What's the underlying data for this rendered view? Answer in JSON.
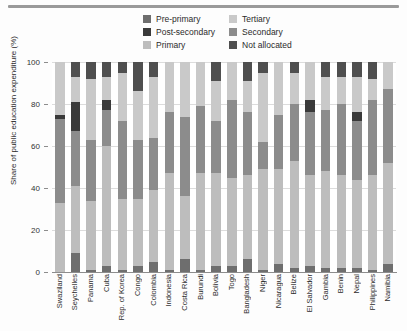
{
  "chart_data": {
    "type": "bar",
    "subtype": "stacked-bar-100",
    "title": "",
    "xlabel": "",
    "ylabel": "Share of public education expenditure (%)",
    "ylim": [
      0,
      100
    ],
    "yticks": [
      0,
      20,
      40,
      60,
      80,
      100
    ],
    "grid": true,
    "legend_position": "top-center",
    "legend": [
      {
        "name": "Pre-primary",
        "color": "#6e6e6e"
      },
      {
        "name": "Tertiary",
        "color": "#c9c9c9"
      },
      {
        "name": "Post-secondary",
        "color": "#3a3a3a"
      },
      {
        "name": "Secondary",
        "color": "#8c8c8c"
      },
      {
        "name": "Primary",
        "color": "#bdbdbd"
      },
      {
        "name": "Not allocated",
        "color": "#4f4f4f"
      }
    ],
    "categories": [
      "Swaziland",
      "Seychelles",
      "Panama",
      "Cuba",
      "Rep. of Korea",
      "Congo",
      "Colombia",
      "Indonesia",
      "Costa Rica",
      "Burundi",
      "Bolivia",
      "Togo",
      "Bangladesh",
      "Niger",
      "Nicaragua",
      "Belize",
      "El Salvador",
      "Gambia",
      "Benin",
      "Nepal",
      "Philippines",
      "Namibia"
    ],
    "stack_order": [
      "Pre-primary",
      "Primary",
      "Secondary",
      "Post-secondary",
      "Tertiary",
      "Not allocated"
    ],
    "series": [
      {
        "name": "Pre-primary",
        "color": "#6e6e6e",
        "values": [
          0,
          9,
          1,
          3,
          1,
          3,
          5,
          1,
          6,
          1,
          3,
          3,
          6,
          1,
          4,
          2,
          3,
          2,
          2,
          2,
          1,
          4
        ]
      },
      {
        "name": "Primary",
        "color": "#bdbdbd",
        "values": [
          33,
          32,
          33,
          57,
          34,
          32,
          34,
          46,
          30,
          46,
          44,
          42,
          40,
          48,
          45,
          51,
          43,
          46,
          44,
          42,
          45,
          48
        ]
      },
      {
        "name": "Secondary",
        "color": "#8c8c8c",
        "values": [
          40,
          26,
          29,
          17,
          37,
          28,
          25,
          29,
          38,
          32,
          25,
          37,
          30,
          13,
          26,
          27,
          30,
          29,
          34,
          28,
          36,
          35
        ]
      },
      {
        "name": "Post-secondary",
        "color": "#3a3a3a",
        "values": [
          2,
          14,
          0,
          5,
          0,
          0,
          0,
          0,
          0,
          0,
          0,
          0,
          0,
          0,
          0,
          0,
          6,
          0,
          0,
          4,
          0,
          0
        ]
      },
      {
        "name": "Tertiary",
        "color": "#c9c9c9",
        "values": [
          25,
          12,
          29,
          11,
          23,
          23,
          29,
          24,
          26,
          21,
          19,
          18,
          15,
          33,
          25,
          15,
          18,
          16,
          13,
          17,
          10,
          13
        ]
      },
      {
        "name": "Not allocated",
        "color": "#4f4f4f",
        "values": [
          0,
          7,
          8,
          7,
          5,
          14,
          7,
          0,
          0,
          0,
          9,
          0,
          9,
          5,
          0,
          5,
          0,
          7,
          7,
          7,
          8,
          0
        ]
      }
    ]
  },
  "axis": {
    "y_title": "Share of public education expenditure (%)",
    "y_tick_labels": [
      "100",
      "80",
      "60",
      "40",
      "20",
      "0"
    ]
  }
}
